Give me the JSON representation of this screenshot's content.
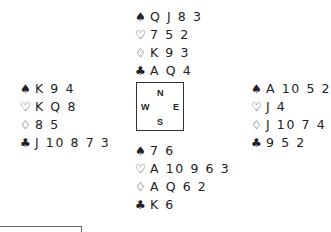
{
  "suits": {
    "spades": "♠",
    "hearts": "♡",
    "diamonds": "♢",
    "clubs": "♣"
  },
  "compass": {
    "north": "N",
    "west": "W",
    "east": "E",
    "south": "S"
  },
  "hands": {
    "north": {
      "spades": "Q J 8 3",
      "hearts": "7 5 2",
      "diamonds": "K 9 3",
      "clubs": "A Q 4"
    },
    "west": {
      "spades": "K 9 4",
      "hearts": "K Q 8",
      "diamonds": "8 5",
      "clubs": "J 10 8 7 3"
    },
    "east": {
      "spades": "A 10 5 2",
      "hearts": "J 4",
      "diamonds": "J 10 7 4",
      "clubs": "9 5 2"
    },
    "south": {
      "spades": "7 6",
      "hearts": "A 10 9 6 3",
      "diamonds": "A Q 6 2",
      "clubs": "K 6"
    }
  }
}
